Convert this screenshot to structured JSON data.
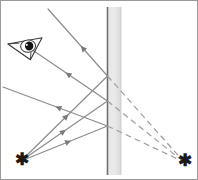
{
  "figure": {
    "kind": "optics-ray-diagram",
    "width": 198,
    "height": 180,
    "background": "#ffffff",
    "border_color": "#9a9a9a"
  },
  "colors": {
    "ray": "#8c8c8c",
    "ray_dark": "#7a7a7a",
    "dashed_ray": "#9e9e9e",
    "mirror_face": "#6f6f6f",
    "mirror_body_top": "#e9e9e9",
    "mirror_body_bottom": "#d8d8d8",
    "eye_outline": "#3a3a3a",
    "eye_pupil": "#141414",
    "star": "#1a1a1a"
  },
  "mirror": {
    "label": "plane-mirror",
    "x_face": 106.5,
    "x_back": 120.0,
    "y_top": 6.0,
    "y_bottom": 174.0,
    "face_line_width": 1.6
  },
  "object": {
    "label": "object-star",
    "symbol": "✱",
    "x": 20.0,
    "y": 160.0
  },
  "image": {
    "label": "virtual-image-star",
    "symbol": "✱",
    "x": 183.0,
    "y": 161.0
  },
  "eye": {
    "label": "observer-eye",
    "x": 26.0,
    "y": 45.0,
    "rotation_deg": -22
  },
  "incident_rays": [
    {
      "name": "incident-ray-upper",
      "x1": 20.0,
      "y1": 160.0,
      "x2": 106.5,
      "y2": 75.0,
      "arrow_t": 0.55
    },
    {
      "name": "incident-ray-middle",
      "x1": 20.0,
      "y1": 160.0,
      "x2": 106.5,
      "y2": 100.0,
      "arrow_t": 0.52
    },
    {
      "name": "incident-ray-lower",
      "x1": 20.0,
      "y1": 160.0,
      "x2": 106.5,
      "y2": 125.0,
      "arrow_t": 0.58
    }
  ],
  "reflected_rays": [
    {
      "name": "reflected-ray-upper",
      "x1": 106.5,
      "y1": 75.0,
      "x2": 47.0,
      "y2": 8.0,
      "arrow_t": 0.45
    },
    {
      "name": "reflected-ray-middle",
      "x1": 106.5,
      "y1": 100.0,
      "x2": 30.0,
      "y2": 48.0,
      "arrow_t": 0.55
    },
    {
      "name": "reflected-ray-lower",
      "x1": 106.5,
      "y1": 125.0,
      "x2": 2.0,
      "y2": 86.0,
      "arrow_t": 0.5
    }
  ],
  "virtual_rays": [
    {
      "name": "virtual-ray-upper",
      "x1": 106.5,
      "y1": 75.0,
      "x2": 183.0,
      "y2": 161.0
    },
    {
      "name": "virtual-ray-middle",
      "x1": 106.5,
      "y1": 100.0,
      "x2": 183.0,
      "y2": 161.0
    },
    {
      "name": "virtual-ray-lower",
      "x1": 106.5,
      "y1": 125.0,
      "x2": 183.0,
      "y2": 161.0
    }
  ],
  "dash_pattern": "6 4",
  "line_width": 1.2,
  "arrow_size": 6.2
}
